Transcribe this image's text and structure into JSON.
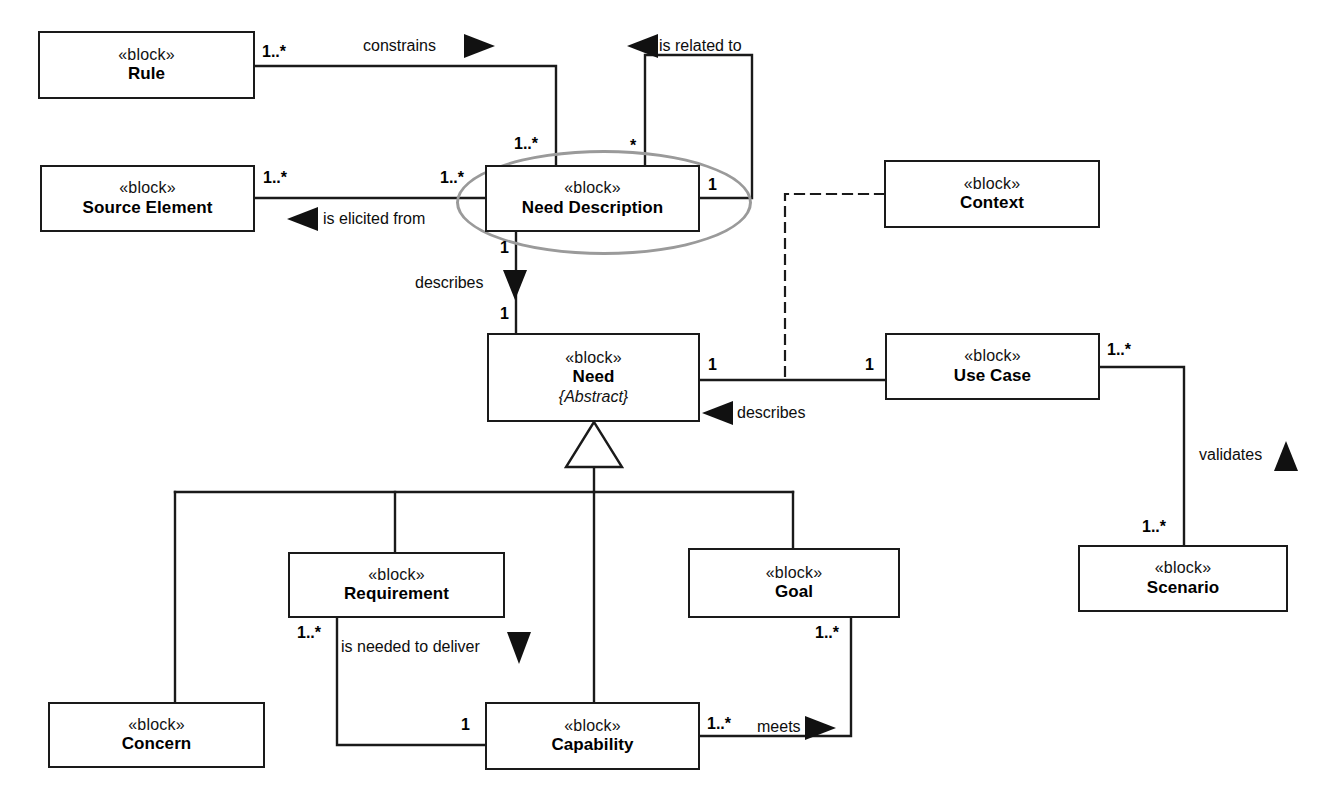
{
  "diagram": {
    "type": "SysML Block Definition Diagram",
    "stereotype_label": "«block»",
    "blocks": [
      {
        "id": "rule",
        "stereotype": "«block»",
        "name": "Rule",
        "modifier": ""
      },
      {
        "id": "source-element",
        "stereotype": "«block»",
        "name": "Source Element",
        "modifier": ""
      },
      {
        "id": "need-description",
        "stereotype": "«block»",
        "name": "Need Description",
        "modifier": ""
      },
      {
        "id": "context",
        "stereotype": "«block»",
        "name": "Context",
        "modifier": ""
      },
      {
        "id": "need",
        "stereotype": "«block»",
        "name": "Need",
        "modifier": "{Abstract}"
      },
      {
        "id": "use-case",
        "stereotype": "«block»",
        "name": "Use Case",
        "modifier": ""
      },
      {
        "id": "scenario",
        "stereotype": "«block»",
        "name": "Scenario",
        "modifier": ""
      },
      {
        "id": "concern",
        "stereotype": "«block»",
        "name": "Concern",
        "modifier": ""
      },
      {
        "id": "requirement",
        "stereotype": "«block»",
        "name": "Requirement",
        "modifier": ""
      },
      {
        "id": "capability",
        "stereotype": "«block»",
        "name": "Capability",
        "modifier": ""
      },
      {
        "id": "goal",
        "stereotype": "«block»",
        "name": "Goal",
        "modifier": ""
      }
    ],
    "relationship_labels": {
      "constrains": "constrains",
      "is_related_to": "is related to",
      "is_elicited_from": "is elicited from",
      "describes_need": "describes",
      "describes_use_case": "describes",
      "validates": "validates",
      "is_needed_to_deliver": "is needed to deliver",
      "meets": "meets"
    },
    "multiplicities": {
      "rule_to_need_description": "1..*",
      "need_description_from_rule": "1..*",
      "need_description_related_source": "*",
      "need_description_related_target": "1",
      "source_element_out": "1..*",
      "need_description_from_source": "1..*",
      "need_description_describes": "1",
      "need_from_description": "1",
      "need_to_use_case": "1",
      "use_case_from_need": "1",
      "use_case_to_scenario": "1..*",
      "scenario_from_use_case": "1..*",
      "requirement_to_capability": "1..*",
      "capability_from_requirement": "1",
      "capability_to_goal": "1..*",
      "goal_from_capability": "1..*"
    },
    "colors": {
      "line": "#1a1a1a",
      "highlight": "#9a9a9a",
      "background": "#ffffff",
      "text": "#000000"
    }
  }
}
